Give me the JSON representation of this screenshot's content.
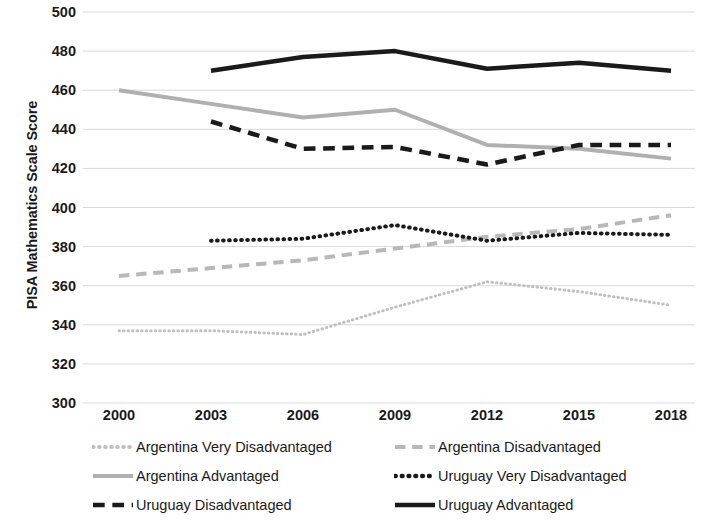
{
  "chart_data": {
    "type": "line",
    "title": "",
    "xlabel": "",
    "ylabel": "PISA Mathematics Scale Score",
    "x": [
      2000,
      2003,
      2006,
      2009,
      2012,
      2015,
      2018
    ],
    "xticklabels": [
      "2000",
      "2003",
      "2006",
      "2009",
      "2012",
      "2015",
      "2018"
    ],
    "yticklabels": [
      "300",
      "320",
      "340",
      "360",
      "380",
      "400",
      "420",
      "440",
      "460",
      "480",
      "500"
    ],
    "ylim": [
      300,
      500
    ],
    "ytick_step": 20,
    "grid": "horizontal",
    "legend_position": "bottom",
    "series": [
      {
        "name": "Argentina Very Disadvantaged",
        "style": "dotted",
        "color": "#c0c0c0",
        "width": 3,
        "x": [
          2000,
          2003,
          2006,
          2009,
          2012,
          2015,
          2018
        ],
        "values": [
          337,
          337,
          335,
          349,
          362,
          357,
          350
        ]
      },
      {
        "name": "Argentina Disadvantaged",
        "style": "dashed",
        "color": "#b8b8b8",
        "width": 4,
        "x": [
          2000,
          2003,
          2006,
          2009,
          2012,
          2015,
          2018
        ],
        "values": [
          365,
          369,
          373,
          379,
          385,
          389,
          396
        ]
      },
      {
        "name": "Argentina Advantaged",
        "style": "solid",
        "color": "#b0b0b0",
        "width": 4,
        "x": [
          2000,
          2003,
          2006,
          2009,
          2012,
          2015,
          2018
        ],
        "values": [
          460,
          453,
          446,
          450,
          432,
          430,
          425
        ]
      },
      {
        "name": "Uruguay Very Disadvantaged",
        "style": "dotted",
        "color": "#1a1a1a",
        "width": 4,
        "x": [
          2003,
          2006,
          2009,
          2012,
          2015,
          2018
        ],
        "values": [
          383,
          384,
          391,
          383,
          387,
          386
        ]
      },
      {
        "name": "Uruguay Disadvantaged",
        "style": "dashed",
        "color": "#1a1a1a",
        "width": 4.5,
        "x": [
          2003,
          2006,
          2009,
          2012,
          2015,
          2018
        ],
        "values": [
          444,
          430,
          431,
          422,
          432,
          432
        ]
      },
      {
        "name": "Uruguay Advantaged",
        "style": "solid",
        "color": "#1a1a1a",
        "width": 4.5,
        "x": [
          2003,
          2006,
          2009,
          2012,
          2015,
          2018
        ],
        "values": [
          470,
          477,
          480,
          471,
          474,
          470
        ]
      }
    ]
  },
  "axis": {
    "y_title": "PISA Mathematics Scale Score",
    "y_ticks": [
      "500",
      "480",
      "460",
      "440",
      "420",
      "400",
      "380",
      "360",
      "340",
      "320",
      "300"
    ],
    "x_ticks": [
      "2000",
      "2003",
      "2006",
      "2009",
      "2012",
      "2015",
      "2018"
    ]
  },
  "legend": {
    "entries": [
      {
        "label": "Argentina Very Disadvantaged",
        "style": "dotted",
        "color": "#c0c0c0"
      },
      {
        "label": "Argentina Disadvantaged",
        "style": "dashed",
        "color": "#b8b8b8"
      },
      {
        "label": "Argentina Advantaged",
        "style": "solid",
        "color": "#b0b0b0"
      },
      {
        "label": "Uruguay Very Disadvantaged",
        "style": "dotted",
        "color": "#1a1a1a"
      },
      {
        "label": "Uruguay Disadvantaged",
        "style": "dashed",
        "color": "#1a1a1a"
      },
      {
        "label": "Uruguay Advantaged",
        "style": "solid",
        "color": "#1a1a1a"
      }
    ]
  },
  "colors": {
    "gridline": "#d9d9d9",
    "text": "#1a1a1a",
    "background": "#ffffff"
  }
}
